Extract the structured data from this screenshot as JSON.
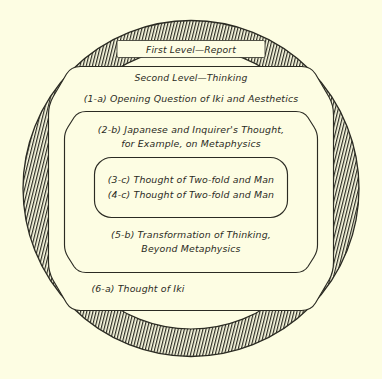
{
  "figure": {
    "background_color": "#fdfde3",
    "ink_color": "#2b2b23",
    "type": "concentric-nested-diagram",
    "shape_outer": "circle",
    "shape_inner": "rounded-octagon"
  },
  "rings": {
    "outer": {
      "name": "first-level-ring",
      "fill": "hatched",
      "label": "First Level—Report"
    },
    "second": {
      "name": "second-level-region",
      "label": "Second Level—Thinking"
    }
  },
  "items": [
    {
      "id": "1-a",
      "marker": "(1-a)",
      "text": "Opening Question of Iki and Aesthetics",
      "lines": [
        "(1-a) Opening Question of Iki and Aesthetics"
      ]
    },
    {
      "id": "2-b",
      "marker": "(2-b)",
      "text": "Japanese and Inquirer's Thought, for Example, on Metaphysics",
      "lines": [
        "(2-b) Japanese and Inquirer's Thought,",
        "for Example, on Metaphysics"
      ]
    },
    {
      "id": "3-c",
      "marker": "(3-c)",
      "text": "Thought of Two-fold and Man",
      "lines": [
        "(3-c) Thought of Two-fold and Man"
      ]
    },
    {
      "id": "4-c",
      "marker": "(4-c)",
      "text": "Thought of Two-fold and Man",
      "lines": [
        "(4-c) Thought of Two-fold and Man"
      ]
    },
    {
      "id": "5-b",
      "marker": "(5-b)",
      "text": "Transformation of Thinking, Beyond Metaphysics",
      "lines": [
        "(5-b) Transformation of Thinking,",
        "Beyond Metaphysics"
      ]
    },
    {
      "id": "6-a",
      "marker": "(6-a)",
      "text": "Thought of Iki",
      "lines": [
        "(6-a) Thought of Iki"
      ]
    }
  ],
  "text": {
    "first_level": "First Level—Report",
    "second_level": "Second Level—Thinking",
    "item_1a": "(1-a) Opening Question of Iki and Aesthetics",
    "item_2b_line1": "(2-b) Japanese and Inquirer's Thought,",
    "item_2b_line2": "for Example, on Metaphysics",
    "item_3c": "(3-c) Thought of Two-fold and Man",
    "item_4c": "(4-c) Thought of Two-fold and Man",
    "item_5b_line1": "(5-b) Transformation of Thinking,",
    "item_5b_line2": "Beyond Metaphysics",
    "item_6a": "(6-a) Thought of Iki"
  }
}
